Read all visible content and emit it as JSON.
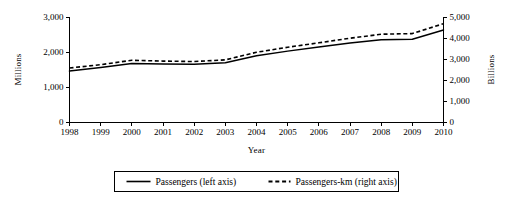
{
  "chart_data": {
    "type": "line",
    "title": "",
    "xlabel": "Year",
    "categories": [
      "1998",
      "1999",
      "2000",
      "2001",
      "2002",
      "2003",
      "2004",
      "2005",
      "2006",
      "2007",
      "2008",
      "2009",
      "2010"
    ],
    "grid": false,
    "legend_position": "bottom",
    "axes": {
      "left": {
        "label": "Millions",
        "ticks": [
          "0",
          "1,000",
          "2,000",
          "3,000"
        ],
        "tick_values": [
          0,
          1000,
          2000,
          3000
        ],
        "ylim": [
          0,
          3000
        ]
      },
      "right": {
        "label": "Billions",
        "ticks": [
          "0",
          "1,000",
          "2,000",
          "3,000",
          "4,000",
          "5,000"
        ],
        "tick_values": [
          0,
          1000,
          2000,
          3000,
          4000,
          5000
        ],
        "ylim": [
          0,
          5000
        ]
      }
    },
    "series": [
      {
        "name": "Passengers (left axis)",
        "axis": "left",
        "style": "solid",
        "unit": "Millions",
        "values": [
          1455,
          1560,
          1670,
          1655,
          1650,
          1690,
          1890,
          2025,
          2140,
          2260,
          2350,
          2365,
          2630
        ]
      },
      {
        "name": "Passengers-km (right axis)",
        "axis": "right",
        "style": "dashed",
        "unit": "Billions",
        "values": [
          2570,
          2730,
          2940,
          2900,
          2880,
          2960,
          3320,
          3560,
          3770,
          3990,
          4180,
          4210,
          4680
        ]
      }
    ],
    "legend": [
      {
        "label": "Passengers (left axis)",
        "style": "solid"
      },
      {
        "label": "Passengers-km (right axis)",
        "style": "dashed"
      }
    ]
  }
}
